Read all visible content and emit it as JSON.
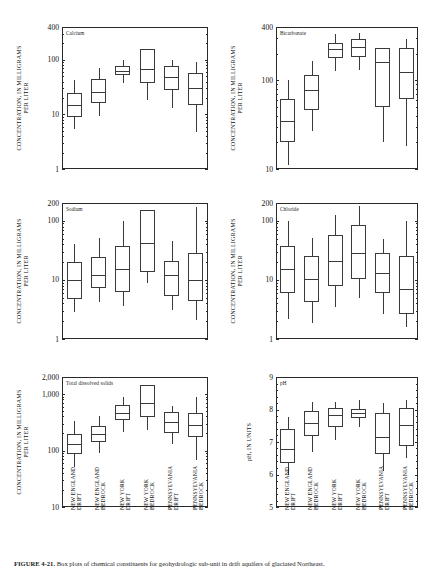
{
  "figure": {
    "caption_label": "FIGURE 4-21.",
    "caption_text": "Box plots of chemical constituents for geohydrologic sub-unit in drift aquifers of glaciated Northeast.",
    "categories": [
      "NEW ENGLAND DRIFT",
      "NEW ENGLAND BEDROCK",
      "NEW YORK DRIFT",
      "NEW YORK BEDROCK",
      "PENNSYLVANIA DRIFT",
      "PENNSYLVANIA BEDROCK"
    ],
    "categories_lines": [
      [
        "NEW ENGLAND",
        "DRIFT"
      ],
      [
        "NEW ENGLAND",
        "BEDROCK"
      ],
      [
        "NEW YORK",
        "DRIFT"
      ],
      [
        "NEW YORK",
        "BEDROCK"
      ],
      [
        "PENNSYLVANIA",
        "DRIFT"
      ],
      [
        "PENNSYLVANIA",
        "BEDROCK"
      ]
    ]
  },
  "chart_data": [
    {
      "id": "calcium",
      "type": "box",
      "title": "Calcium",
      "ylabel": "CONCENTRATION, IN MILLIGRAMS PER LITER",
      "ylabel_lines": [
        "CONCENTRATION, IN MILLIGRAMS",
        "PER LITER"
      ],
      "yscale": "log",
      "ylim": [
        1,
        400
      ],
      "ytick_labels": [
        "400",
        "100",
        "10",
        "1"
      ],
      "ytick_values": [
        400,
        100,
        10,
        1
      ],
      "xlabel": "",
      "grid": false,
      "categories": [
        "NEW ENGLAND DRIFT",
        "NEW ENGLAND BEDROCK",
        "NEW YORK DRIFT",
        "NEW YORK BEDROCK",
        "PENNSYLVANIA DRIFT",
        "PENNSYLVANIA BEDROCK"
      ],
      "boxes": [
        {
          "category": "NEW ENGLAND DRIFT",
          "low": 5.5,
          "q1": 9.0,
          "median": 15.0,
          "q3": 25.0,
          "high": 42.0
        },
        {
          "category": "NEW ENGLAND BEDROCK",
          "low": 9.5,
          "q1": 16.0,
          "median": 26.0,
          "q3": 45.0,
          "high": 72.0
        },
        {
          "category": "NEW YORK DRIFT",
          "low": 38.0,
          "q1": 52.0,
          "median": 63.0,
          "q3": 78.0,
          "high": 100.0
        },
        {
          "category": "NEW YORK BEDROCK",
          "low": 18.0,
          "q1": 38.0,
          "median": 68.0,
          "q3": 155.0,
          "high": 155.0
        },
        {
          "category": "PENNSYLVANIA DRIFT",
          "low": 13.0,
          "q1": 28.0,
          "median": 49.0,
          "q3": 77.0,
          "high": 100.0
        },
        {
          "category": "PENNSYLVANIA BEDROCK",
          "low": 4.8,
          "q1": 15.0,
          "median": 31.0,
          "q3": 57.0,
          "high": 90.0
        }
      ]
    },
    {
      "id": "bicarbonate",
      "type": "box",
      "title": "Bicarbonate",
      "ylabel": "CONCENTRATION, IN MILLIGRAMS PER LITER",
      "ylabel_lines": [
        "CONCENTRATION, IN MILLIGRAMS",
        "PER LITER"
      ],
      "yscale": "log",
      "ylim": [
        10,
        400
      ],
      "ytick_labels": [
        "400",
        "100",
        "10"
      ],
      "ytick_values": [
        400,
        100,
        10
      ],
      "xlabel": "",
      "grid": false,
      "categories": [
        "NEW ENGLAND DRIFT",
        "NEW ENGLAND BEDROCK",
        "NEW YORK DRIFT",
        "NEW YORK BEDROCK",
        "PENNSYLVANIA DRIFT",
        "PENNSYLVANIA BEDROCK"
      ],
      "boxes": [
        {
          "category": "NEW ENGLAND DRIFT",
          "low": 11.0,
          "q1": 20.0,
          "median": 35.0,
          "q3": 62.0,
          "high": 100.0
        },
        {
          "category": "NEW ENGLAND BEDROCK",
          "low": 27.0,
          "q1": 46.0,
          "median": 78.0,
          "q3": 115.0,
          "high": 165.0
        },
        {
          "category": "NEW YORK DRIFT",
          "low": 128.0,
          "q1": 180.0,
          "median": 225.0,
          "q3": 265.0,
          "high": 330.0
        },
        {
          "category": "NEW YORK BEDROCK",
          "low": 130.0,
          "q1": 185.0,
          "median": 240.0,
          "q3": 290.0,
          "high": 340.0
        },
        {
          "category": "PENNSYLVANIA DRIFT",
          "low": 20.0,
          "q1": 50.0,
          "median": 160.0,
          "q3": 230.0,
          "high": 230.0
        },
        {
          "category": "PENNSYLVANIA BEDROCK",
          "low": 18.0,
          "q1": 62.0,
          "median": 125.0,
          "q3": 230.0,
          "high": 290.0
        }
      ]
    },
    {
      "id": "sodium",
      "type": "box",
      "title": "Sodium",
      "ylabel": "CONCENTRATION, IN MILLIGRAMS PER LITER",
      "ylabel_lines": [
        "CONCENTRATION, IN MILLIGRAMS",
        "PER LITER"
      ],
      "yscale": "log",
      "ylim": [
        1,
        200
      ],
      "ytick_labels": [
        "200",
        "100",
        "10",
        "1"
      ],
      "ytick_values": [
        200,
        100,
        10,
        1
      ],
      "xlabel": "",
      "grid": false,
      "categories": [
        "NEW ENGLAND DRIFT",
        "NEW ENGLAND BEDROCK",
        "NEW YORK DRIFT",
        "NEW YORK BEDROCK",
        "PENNSYLVANIA DRIFT",
        "PENNSYLVANIA BEDROCK"
      ],
      "boxes": [
        {
          "category": "NEW ENGLAND DRIFT",
          "low": 2.9,
          "q1": 4.8,
          "median": 10.0,
          "q3": 20.0,
          "high": 40.0
        },
        {
          "category": "NEW ENGLAND BEDROCK",
          "low": 4.2,
          "q1": 7.4,
          "median": 12.0,
          "q3": 24.0,
          "high": 52.0
        },
        {
          "category": "NEW YORK DRIFT",
          "low": 3.6,
          "q1": 6.2,
          "median": 15.0,
          "q3": 38.0,
          "high": 100.0
        },
        {
          "category": "NEW YORK BEDROCK",
          "low": 9.0,
          "q1": 13.5,
          "median": 42.0,
          "q3": 150.0,
          "high": 150.0
        },
        {
          "category": "PENNSYLVANIA DRIFT",
          "low": 3.1,
          "q1": 5.4,
          "median": 12.0,
          "q3": 21.0,
          "high": 45.0
        },
        {
          "category": "PENNSYLVANIA BEDROCK",
          "low": 2.1,
          "q1": 4.4,
          "median": 9.8,
          "q3": 28.0,
          "high": 170.0
        }
      ]
    },
    {
      "id": "chloride",
      "type": "box",
      "title": "Chloride",
      "ylabel": "CONCENTRATION, IN MILLIGRAMS PER LITER",
      "ylabel_lines": [
        "CONCENTRATION, IN MILLIGRAMS",
        "PER LITER"
      ],
      "yscale": "log",
      "ylim": [
        1,
        200
      ],
      "ytick_labels": [
        "200",
        "100",
        "10",
        "1"
      ],
      "ytick_values": [
        200,
        100,
        10,
        1
      ],
      "xlabel": "",
      "grid": false,
      "categories": [
        "NEW ENGLAND DRIFT",
        "NEW ENGLAND BEDROCK",
        "NEW YORK DRIFT",
        "NEW YORK BEDROCK",
        "PENNSYLVANIA DRIFT",
        "PENNSYLVANIA BEDROCK"
      ],
      "boxes": [
        {
          "category": "NEW ENGLAND DRIFT",
          "low": 2.2,
          "q1": 6.0,
          "median": 15.0,
          "q3": 38.0,
          "high": 98.0
        },
        {
          "category": "NEW ENGLAND BEDROCK",
          "low": 1.9,
          "q1": 4.3,
          "median": 10.2,
          "q3": 25.0,
          "high": 52.0
        },
        {
          "category": "NEW YORK DRIFT",
          "low": 3.5,
          "q1": 8.0,
          "median": 21.0,
          "q3": 58.0,
          "high": 125.0
        },
        {
          "category": "NEW YORK BEDROCK",
          "low": 5.0,
          "q1": 10.2,
          "median": 28.0,
          "q3": 85.0,
          "high": 175.0
        },
        {
          "category": "PENNSYLVANIA DRIFT",
          "low": 2.6,
          "q1": 6.1,
          "median": 13.0,
          "q3": 29.0,
          "high": 50.0
        },
        {
          "category": "PENNSYLVANIA BEDROCK",
          "low": 1.6,
          "q1": 2.6,
          "median": 7.0,
          "q3": 25.0,
          "high": 98.0
        }
      ]
    },
    {
      "id": "total-dissolved-solids",
      "type": "box",
      "title": "Total dissolved solids",
      "ylabel": "CONCENTRATION, IN MILLIGRAMS PER LITER",
      "ylabel_lines": [
        "CONCENTRATION, IN MILLIGRAMS",
        "PER LITER"
      ],
      "yscale": "log",
      "ylim": [
        10,
        2000
      ],
      "ytick_labels": [
        "2,000",
        "1,000",
        "100",
        "10"
      ],
      "ytick_values": [
        2000,
        1000,
        100,
        10
      ],
      "xlabel": "",
      "grid": false,
      "categories": [
        "NEW ENGLAND DRIFT",
        "NEW ENGLAND BEDROCK",
        "NEW YORK DRIFT",
        "NEW YORK BEDROCK",
        "PENNSYLVANIA DRIFT",
        "PENNSYLVANIA BEDROCK"
      ],
      "boxes": [
        {
          "category": "NEW ENGLAND DRIFT",
          "low": 52.0,
          "q1": 88.0,
          "median": 128.0,
          "q3": 195.0,
          "high": 330.0
        },
        {
          "category": "NEW ENGLAND BEDROCK",
          "low": 90.0,
          "q1": 140.0,
          "median": 195.0,
          "q3": 270.0,
          "high": 400.0
        },
        {
          "category": "NEW YORK DRIFT",
          "low": 215.0,
          "q1": 350.0,
          "median": 460.0,
          "q3": 640.0,
          "high": 900.0
        },
        {
          "category": "NEW YORK BEDROCK",
          "low": 230.0,
          "q1": 390.0,
          "median": 700.0,
          "q3": 1450.0,
          "high": 1450.0
        },
        {
          "category": "PENNSYLVANIA DRIFT",
          "low": 130.0,
          "q1": 200.0,
          "median": 320.0,
          "q3": 490.0,
          "high": 620.0
        },
        {
          "category": "PENNSYLVANIA BEDROCK",
          "low": 68.0,
          "q1": 175.0,
          "median": 280.0,
          "q3": 470.0,
          "high": 900.0
        }
      ]
    },
    {
      "id": "ph",
      "type": "box",
      "title": "pH",
      "ylabel": "pH, IN UNITS",
      "ylabel_lines": [
        "pH, IN UNITS"
      ],
      "yscale": "linear",
      "ylim": [
        5,
        9
      ],
      "ytick_labels": [
        "9",
        "8",
        "7",
        "6",
        "5"
      ],
      "ytick_values": [
        9,
        8,
        7,
        6,
        5
      ],
      "xlabel": "",
      "grid": false,
      "categories": [
        "NEW ENGLAND DRIFT",
        "NEW ENGLAND BEDROCK",
        "NEW YORK DRIFT",
        "NEW YORK BEDROCK",
        "PENNSYLVANIA DRIFT",
        "PENNSYLVANIA BEDROCK"
      ],
      "boxes": [
        {
          "category": "NEW ENGLAND DRIFT",
          "low": 5.97,
          "q1": 6.35,
          "median": 6.8,
          "q3": 7.4,
          "high": 7.78
        },
        {
          "category": "NEW ENGLAND BEDROCK",
          "low": 6.7,
          "q1": 7.18,
          "median": 7.6,
          "q3": 7.95,
          "high": 8.22
        },
        {
          "category": "NEW YORK DRIFT",
          "low": 7.05,
          "q1": 7.45,
          "median": 7.82,
          "q3": 8.05,
          "high": 8.22
        },
        {
          "category": "NEW YORK BEDROCK",
          "low": 7.45,
          "q1": 7.75,
          "median": 7.88,
          "q3": 8.02,
          "high": 8.28
        },
        {
          "category": "PENNSYLVANIA DRIFT",
          "low": 6.1,
          "q1": 6.62,
          "median": 7.15,
          "q3": 7.9,
          "high": 8.2
        },
        {
          "category": "PENNSYLVANIA BEDROCK",
          "low": 6.52,
          "q1": 6.88,
          "median": 7.52,
          "q3": 8.05,
          "high": 8.3
        }
      ]
    }
  ]
}
